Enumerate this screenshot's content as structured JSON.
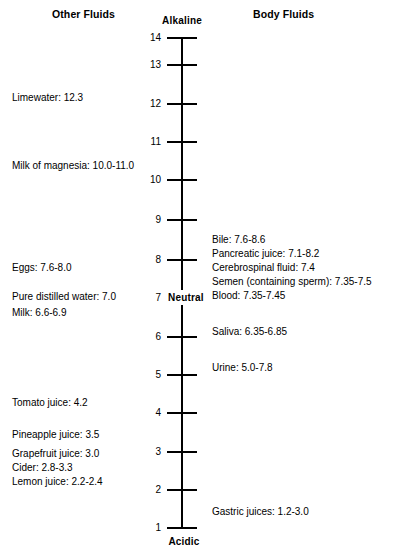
{
  "chart_data": {
    "type": "scatter",
    "xlabel": "",
    "ylabel": "pH",
    "ylim": [
      1,
      14
    ],
    "grid": false,
    "axis_orientation": "vertical",
    "axis_top_label": "Alkaline",
    "axis_bottom_label": "Acidic",
    "axis_midpoint_label": "Neutral",
    "axis_midpoint_value": "7",
    "tick_values": [
      "14",
      "13",
      "12",
      "11",
      "10",
      "9",
      "8",
      "7",
      "6",
      "5",
      "4",
      "3",
      "2",
      "1"
    ],
    "series": [
      {
        "name": "Other Fluids",
        "side": "left",
        "points": [
          {
            "label": "Limewater",
            "value_text": "12.3",
            "ph_low": 12.3,
            "ph_high": 12.3
          },
          {
            "label": "Milk of magnesia",
            "value_text": "10.0-11.0",
            "ph_low": 10.0,
            "ph_high": 11.0
          },
          {
            "label": "Eggs",
            "value_text": "7.6-8.0",
            "ph_low": 7.6,
            "ph_high": 8.0
          },
          {
            "label": "Pure distilled water",
            "value_text": "7.0",
            "ph_low": 7.0,
            "ph_high": 7.0
          },
          {
            "label": "Milk",
            "value_text": "6.6-6.9",
            "ph_low": 6.6,
            "ph_high": 6.9
          },
          {
            "label": "Tomato juice",
            "value_text": "4.2",
            "ph_low": 4.2,
            "ph_high": 4.2
          },
          {
            "label": "Pineapple juice",
            "value_text": "3.5",
            "ph_low": 3.5,
            "ph_high": 3.5
          },
          {
            "label": "Grapefruit juice",
            "value_text": "3.0",
            "ph_low": 3.0,
            "ph_high": 3.0
          },
          {
            "label": "Cider",
            "value_text": "2.8-3.3",
            "ph_low": 2.8,
            "ph_high": 3.3
          },
          {
            "label": "Lemon juice",
            "value_text": "2.2-2.4",
            "ph_low": 2.2,
            "ph_high": 2.4
          }
        ]
      },
      {
        "name": "Body Fluids",
        "side": "right",
        "points": [
          {
            "label": "Bile",
            "value_text": "7.6-8.6",
            "ph_low": 7.6,
            "ph_high": 8.6
          },
          {
            "label": "Pancreatic juice",
            "value_text": "7.1-8.2",
            "ph_low": 7.1,
            "ph_high": 8.2
          },
          {
            "label": "Cerebrospinal fluid",
            "value_text": "7.4",
            "ph_low": 7.4,
            "ph_high": 7.4
          },
          {
            "label": "Semen (containing sperm)",
            "value_text": "7.35-7.5",
            "ph_low": 7.35,
            "ph_high": 7.5
          },
          {
            "label": "Blood",
            "value_text": "7.35-7.45",
            "ph_low": 7.35,
            "ph_high": 7.45
          },
          {
            "label": "Saliva",
            "value_text": "6.35-6.85",
            "ph_low": 6.35,
            "ph_high": 6.85
          },
          {
            "label": "Urine",
            "value_text": "5.0-7.8",
            "ph_low": 5.0,
            "ph_high": 7.8
          },
          {
            "label": "Gastric juices",
            "value_text": "1.2-3.0",
            "ph_low": 1.2,
            "ph_high": 3.0
          }
        ]
      }
    ]
  },
  "headings": {
    "left": "Other Fluids",
    "right": "Body Fluids"
  },
  "axis": {
    "top_label": "Alkaline",
    "bottom_label": "Acidic",
    "neutral_number": "7",
    "neutral_word": "Neutral",
    "ticks": [
      {
        "label": "14",
        "y": 38
      },
      {
        "label": "13",
        "y": 65
      },
      {
        "label": "12",
        "y": 104
      },
      {
        "label": "11",
        "y": 142
      },
      {
        "label": "10",
        "y": 180
      },
      {
        "label": "9",
        "y": 220
      },
      {
        "label": "8",
        "y": 260
      },
      {
        "label": "6",
        "y": 337
      },
      {
        "label": "5",
        "y": 375
      },
      {
        "label": "4",
        "y": 413
      },
      {
        "label": "3",
        "y": 452
      },
      {
        "label": "2",
        "y": 490
      },
      {
        "label": "1",
        "y": 528
      }
    ]
  },
  "left_entries": [
    {
      "text": "Limewater: 12.3",
      "y": 92
    },
    {
      "text": "Milk of magnesia: 10.0-11.0",
      "y": 160
    },
    {
      "text": "Eggs: 7.6-8.0",
      "y": 262
    },
    {
      "text": "Pure distilled water: 7.0",
      "y": 291
    },
    {
      "text": "Milk: 6.6-6.9",
      "y": 307
    },
    {
      "text": "Tomato juice: 4.2",
      "y": 397
    },
    {
      "text": "Pineapple juice: 3.5",
      "y": 429
    },
    {
      "text": "Grapefruit juice: 3.0",
      "y": 448
    },
    {
      "text": "Cider: 2.8-3.3",
      "y": 462
    },
    {
      "text": "Lemon juice: 2.2-2.4",
      "y": 476
    }
  ],
  "right_entries": [
    {
      "text": "Bile: 7.6-8.6",
      "y": 234
    },
    {
      "text": "Pancreatic juice: 7.1-8.2",
      "y": 248
    },
    {
      "text": "Cerebrospinal fluid: 7.4",
      "y": 262
    },
    {
      "text": "Semen (containing sperm): 7.35-7.5",
      "y": 276
    },
    {
      "text": "Blood: 7.35-7.45",
      "y": 290
    },
    {
      "text": "Saliva: 6.35-6.85",
      "y": 326
    },
    {
      "text": "Urine: 5.0-7.8",
      "y": 362
    },
    {
      "text": "Gastric juices: 1.2-3.0",
      "y": 506
    }
  ]
}
